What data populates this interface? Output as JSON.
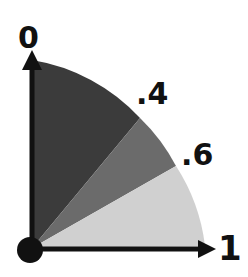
{
  "diagram": {
    "labels": {
      "top": "0",
      "mid1": ".4",
      "mid2": ".6",
      "right": "1"
    },
    "sectors": [
      {
        "name": "sector-0-to-0.4",
        "color": "#3b3b3b"
      },
      {
        "name": "sector-0.4-to-0.6",
        "color": "#6b6b6b"
      },
      {
        "name": "sector-0.6-to-1",
        "color": "#d0d0d0"
      }
    ],
    "axis_color": "#111111"
  }
}
